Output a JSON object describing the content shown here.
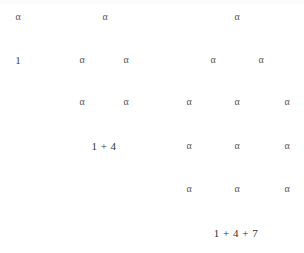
{
  "diagram": {
    "symbol": "α",
    "left_figure": {
      "rows": [
        {
          "items": [
            {
              "text": "α",
              "x": 18,
              "y": 17
            },
            {
              "text": "α",
              "x": 105,
              "y": 17
            }
          ]
        },
        {
          "items": [
            {
              "text": "1",
              "x": 18,
              "y": 60
            },
            {
              "text": "α",
              "x": 82,
              "y": 60
            },
            {
              "text": "α",
              "x": 126,
              "y": 60
            }
          ]
        },
        {
          "items": [
            {
              "text": "α",
              "x": 82,
              "y": 102
            },
            {
              "text": "α",
              "x": 126,
              "y": 102
            }
          ]
        }
      ],
      "caption": "1 + 4"
    },
    "right_figure": {
      "rows": [
        {
          "items": [
            {
              "text": "α",
              "x": 237,
              "y": 17
            }
          ]
        },
        {
          "items": [
            {
              "text": "α",
              "x": 213,
              "y": 60
            },
            {
              "text": "α",
              "x": 261,
              "y": 60
            }
          ]
        },
        {
          "items": [
            {
              "text": "α",
              "x": 189,
              "y": 102
            },
            {
              "text": "α",
              "x": 237,
              "y": 102
            },
            {
              "text": "α",
              "x": 287,
              "y": 102
            }
          ]
        },
        {
          "items": [
            {
              "text": "α",
              "x": 189,
              "y": 146
            },
            {
              "text": "α",
              "x": 237,
              "y": 146
            },
            {
              "text": "α",
              "x": 287,
              "y": 146
            }
          ]
        },
        {
          "items": [
            {
              "text": "α",
              "x": 189,
              "y": 189
            },
            {
              "text": "α",
              "x": 237,
              "y": 189
            },
            {
              "text": "α",
              "x": 287,
              "y": 189
            }
          ]
        }
      ],
      "caption": "1 + 4 + 7"
    }
  }
}
